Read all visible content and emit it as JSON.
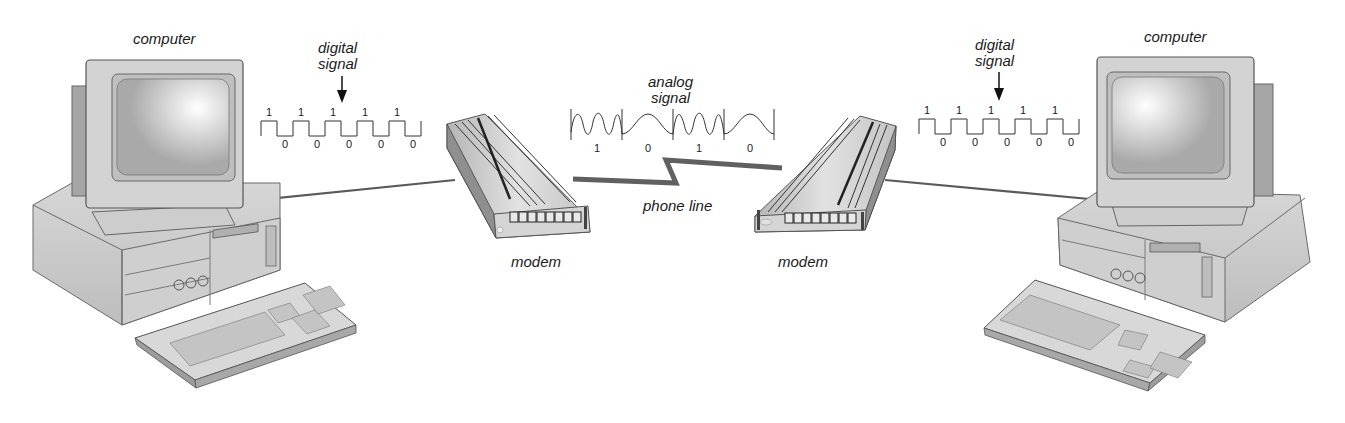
{
  "labels": {
    "left_computer": "computer",
    "right_computer": "computer",
    "left_digital_signal": [
      "digital",
      "signal"
    ],
    "right_digital_signal": [
      "digital",
      "signal"
    ],
    "analog_signal": [
      "analog",
      "signal"
    ],
    "left_modem": "modem",
    "right_modem": "modem",
    "phone_line": "phone line"
  },
  "left_digital_bits": {
    "ones": [
      "1",
      "1",
      "1",
      "1",
      "1"
    ],
    "zeros": [
      "0",
      "0",
      "0",
      "0",
      "0"
    ]
  },
  "right_digital_bits": {
    "ones": [
      "1",
      "1",
      "1",
      "1",
      "1"
    ],
    "zeros": [
      "0",
      "0",
      "0",
      "0",
      "0"
    ]
  },
  "analog_bits": [
    "1",
    "0",
    "1",
    "0"
  ],
  "colors": {
    "background": "#ffffff",
    "device_light": "#dcdcdc",
    "device_mid": "#bcbcbc",
    "device_dark": "#8a8a8a",
    "line": "#555555",
    "text": "#1a1a1a"
  }
}
